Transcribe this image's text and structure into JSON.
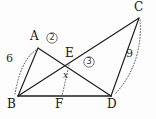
{
  "figure": {
    "type": "geometry-diagram",
    "canvas": {
      "width": 156,
      "height": 119
    },
    "background_color": "#fdfdfd",
    "stroke_color": "#1c1c1c",
    "dotted_color": "#5a5a5a"
  },
  "vertices": [
    {
      "name": "A",
      "label": "A",
      "x": 38,
      "y": 48,
      "label_x": 30,
      "label_y": 30
    },
    {
      "name": "B",
      "label": "B",
      "x": 18,
      "y": 96,
      "label_x": 8,
      "label_y": 99
    },
    {
      "name": "C",
      "label": "C",
      "x": 139,
      "y": 18,
      "label_x": 135,
      "label_y": 2
    },
    {
      "name": "D",
      "label": "D",
      "x": 111,
      "y": 96,
      "label_x": 108,
      "label_y": 99
    },
    {
      "name": "E",
      "label": "E",
      "x": 69,
      "y": 65,
      "label_x": 66,
      "label_y": 48
    },
    {
      "name": "F",
      "label": "F",
      "x": 62,
      "y": 96,
      "label_x": 56,
      "label_y": 99
    }
  ],
  "edges": [
    {
      "name": "edge-ba",
      "from": "B",
      "to": "A",
      "style": "solid"
    },
    {
      "name": "edge-ad",
      "from": "A",
      "to": "D",
      "style": "solid"
    },
    {
      "name": "edge-bc",
      "from": "B",
      "to": "C",
      "style": "solid"
    },
    {
      "name": "edge-cd",
      "from": "C",
      "to": "D",
      "style": "solid"
    },
    {
      "name": "edge-bd",
      "from": "B",
      "to": "D",
      "style": "solid-thick"
    },
    {
      "name": "edge-ef",
      "from": "E",
      "to": "F",
      "style": "dotted"
    }
  ],
  "arcs": [
    {
      "name": "arc-ab",
      "from": "A",
      "to": "B",
      "style": "dotted",
      "bulge": "left"
    },
    {
      "name": "arc-cd",
      "from": "C",
      "to": "D",
      "style": "dotted",
      "bulge": "right"
    }
  ],
  "length_labels": [
    {
      "name": "length-ab",
      "value": "6",
      "x": 7,
      "y": 58,
      "measures": "AB"
    },
    {
      "name": "length-cd",
      "value": "9",
      "x": 128,
      "y": 53,
      "measures": "CD"
    }
  ],
  "segment_labels": [
    {
      "name": "segment-ef",
      "value": "x",
      "x": 64,
      "y": 76,
      "measures": "EF"
    }
  ],
  "region_labels": [
    {
      "name": "region-2",
      "value": "2",
      "x": 52,
      "y": 38,
      "circled": true
    },
    {
      "name": "region-3",
      "value": "3",
      "x": 89,
      "y": 62,
      "circled": true
    }
  ]
}
